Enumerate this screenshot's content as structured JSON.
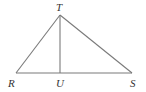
{
  "diagram": {
    "type": "geometry-triangle",
    "colors": {
      "line": "#7a7a7a",
      "text": "#333333",
      "background": "#ffffff"
    },
    "points": {
      "T": {
        "label": "T",
        "x": 60,
        "y": 15
      },
      "R": {
        "label": "R",
        "x": 16,
        "y": 73
      },
      "U": {
        "label": "U",
        "x": 60,
        "y": 73
      },
      "S": {
        "label": "S",
        "x": 132,
        "y": 73
      }
    },
    "segments": [
      "TR",
      "TS",
      "RS",
      "TU"
    ]
  }
}
